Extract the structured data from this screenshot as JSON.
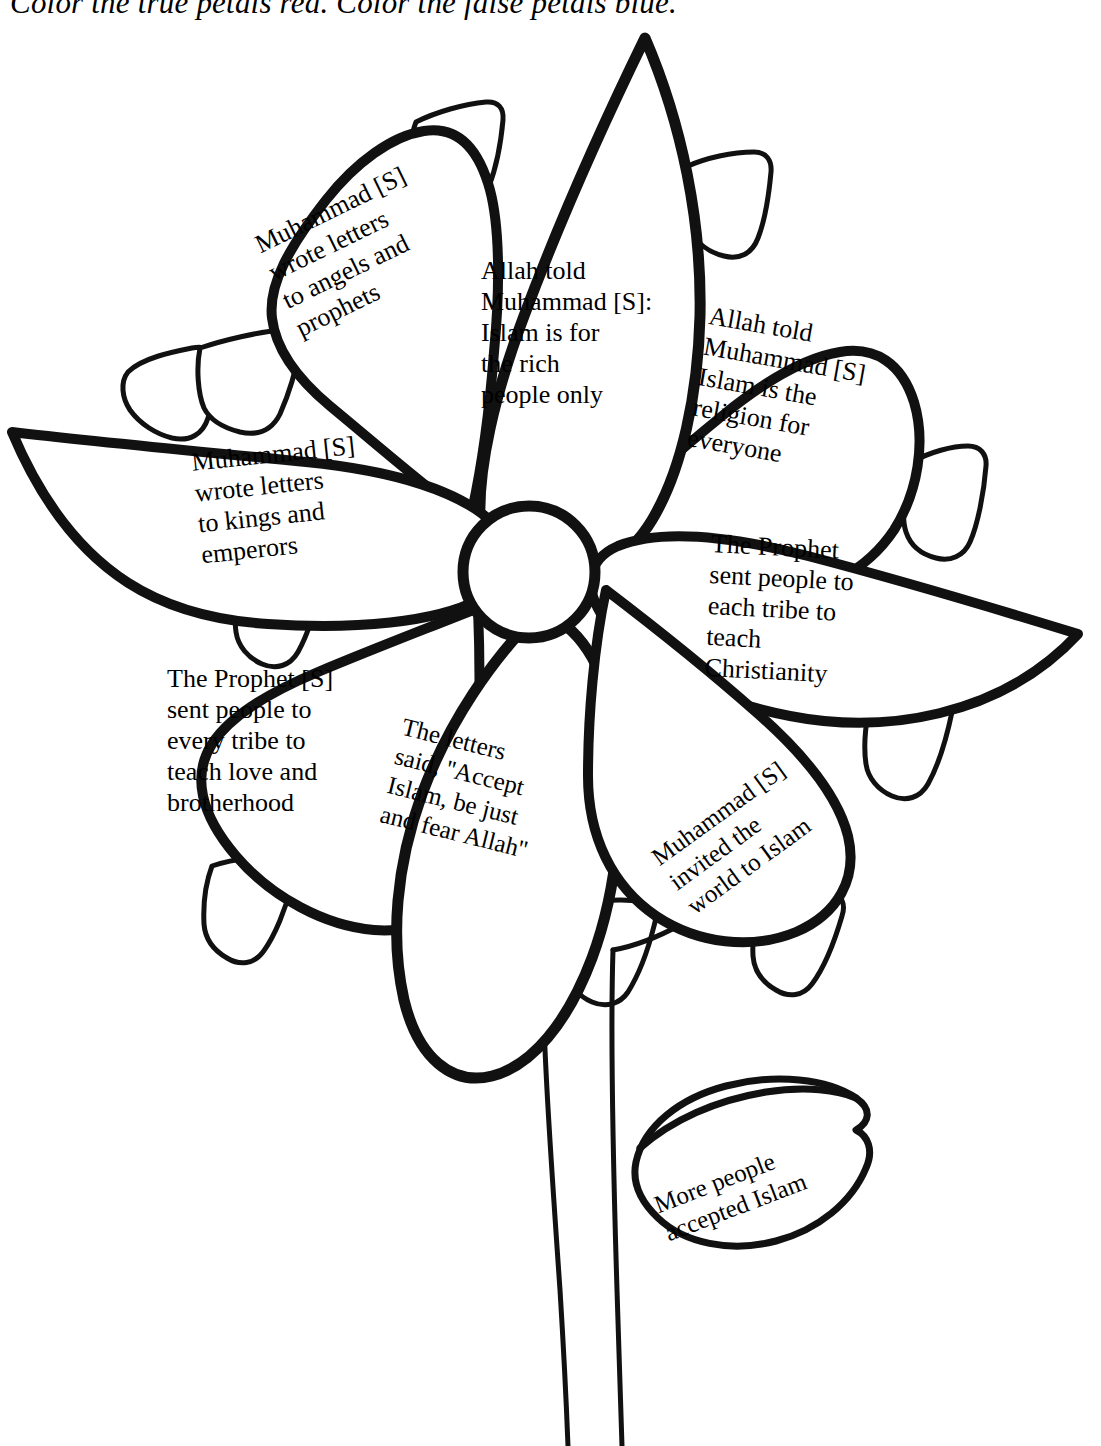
{
  "worksheet": {
    "instruction": "Color the true petals red. Color the false petals blue.",
    "theme": "flower-diagram-true-false",
    "ink_color": "#000000",
    "paper_color": "#ffffff"
  },
  "diagram": {
    "center_label": "",
    "petals": [
      {
        "id": "petal-upper-left",
        "text": "Muhammad [S]\nwrote letters\nto angels and\nprophets",
        "truth": "false",
        "rotation_deg": -26
      },
      {
        "id": "petal-top",
        "text": "Allah told\nMuhammad [S]:\nIslam is for\nthe rich\npeople only",
        "truth": "false",
        "rotation_deg": 0
      },
      {
        "id": "petal-upper-right",
        "text": "Allah told\nMuhammad [S]\nIslam is the\nreligion for\neveryone",
        "truth": "true",
        "rotation_deg": 10
      },
      {
        "id": "petal-left",
        "text": "Muhammad [S]\nwrote letters\nto kings and\nemperors",
        "truth": "true",
        "rotation_deg": -6
      },
      {
        "id": "petal-right",
        "text": "The Prophet\nsent people to\neach tribe to\nteach\nChristianity",
        "truth": "false",
        "rotation_deg": 3
      },
      {
        "id": "petal-lower-left",
        "text": "The Prophet [S]\nsent people to\nevery tribe to\nteach love and\nbrotherhood",
        "truth": "true",
        "rotation_deg": 0
      },
      {
        "id": "petal-bottom",
        "text": "The letters\nsaid,  ''Accept\nIslam, be just\nand fear Allah''",
        "truth": "true",
        "rotation_deg": 14
      },
      {
        "id": "petal-lower-right",
        "text": "Muhammad [S]\ninvited the\nworld to Islam",
        "truth": "true",
        "rotation_deg": -36
      }
    ],
    "leaf": {
      "id": "leaf-lower-right",
      "text": "More people\naccepted Islam",
      "rotation_deg": -21
    },
    "stem": {
      "id": "flower-stem",
      "label": ""
    }
  }
}
